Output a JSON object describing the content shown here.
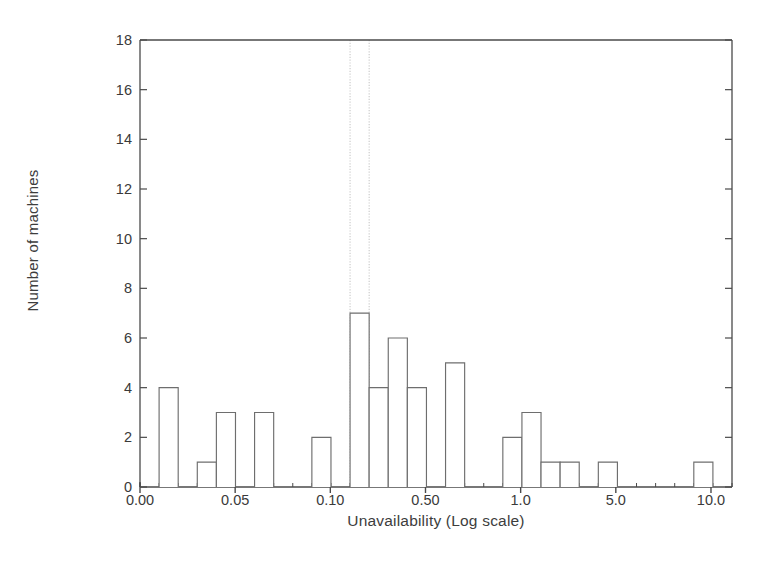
{
  "chart_data": {
    "type": "bar",
    "title": "",
    "subtitle": "",
    "xlabel": "Unavailability (Log scale)",
    "ylabel": "Number of machines",
    "xtick_labels": [
      "0.00",
      "0.05",
      "0.10",
      "0.50",
      "1.0",
      "5.0",
      "10.0"
    ],
    "ytick_labels": [
      "0",
      "2",
      "4",
      "6",
      "8",
      "10",
      "12",
      "14",
      "16",
      "18"
    ],
    "ytick_values": [
      0,
      2,
      4,
      6,
      8,
      10,
      12,
      14,
      16,
      18
    ],
    "ylim": [
      0,
      18
    ],
    "grid": false,
    "legend": null,
    "bin_index": [
      1,
      2,
      3,
      4,
      5,
      6,
      7,
      8,
      9,
      10,
      11,
      12,
      13,
      14,
      15,
      16,
      17,
      18,
      19,
      20,
      21,
      22,
      23,
      24,
      25,
      26,
      27,
      28,
      29,
      30,
      31
    ],
    "values": [
      0,
      4,
      0,
      1,
      3,
      0,
      3,
      0,
      0,
      2,
      0,
      7,
      4,
      6,
      4,
      0,
      5,
      0,
      0,
      2,
      3,
      1,
      1,
      0,
      1,
      0,
      0,
      0,
      0,
      1,
      0
    ],
    "annotations": [
      {
        "type": "vertical-reference-line",
        "bin_index": 11,
        "style": "dotted"
      },
      {
        "type": "vertical-reference-line",
        "bin_index": 12,
        "style": "dotted"
      }
    ]
  },
  "colors": {
    "axis": "#4a4a4a",
    "bar_outline": "#6e6e6e",
    "bar_fill": "#ffffff",
    "reference_line": "#c8c8c8",
    "text": "#3a3a3a",
    "background": "#ffffff"
  }
}
